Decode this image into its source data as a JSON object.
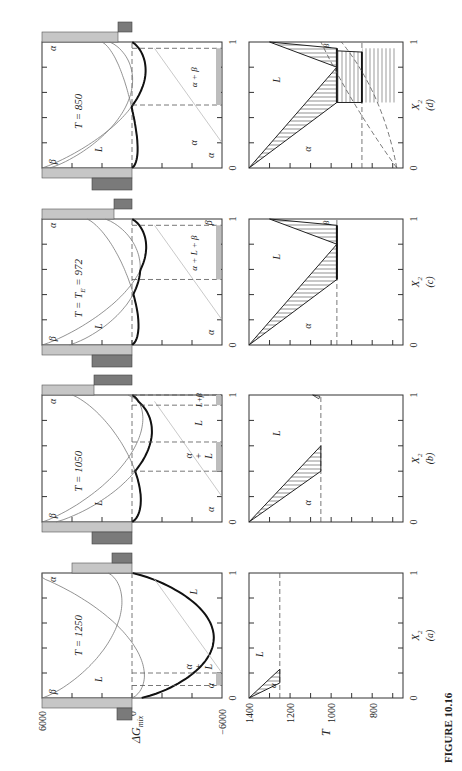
{
  "figure": {
    "caption_label": "FIGURE 10.16",
    "caption_text_partial": "... L  6000  ...  α  8000  ...  β  8000"
  },
  "chart_data": [
    {
      "panel": "a",
      "type": "line",
      "title": "T = 1250",
      "xlabel": "X2",
      "ylabel": "ΔGmix",
      "xlim": [
        0,
        1
      ],
      "ylim": [
        -6000,
        6000
      ],
      "yticks": [
        6000,
        0,
        -6000
      ],
      "xticks": [
        0,
        1
      ],
      "curves": [
        "α",
        "β",
        "L",
        "lower envelope"
      ],
      "region_labels": [
        "α",
        "α + L",
        "L"
      ],
      "arrow_labels": [
        "α"
      ]
    },
    {
      "panel": "a",
      "type": "line",
      "kind": "phase diagram",
      "xlabel": "X2",
      "sublabel": "(a)",
      "ylabel": "T",
      "xlim": [
        0,
        1
      ],
      "ylim": [
        650,
        1400
      ],
      "yticks": [
        1400,
        1200,
        1000,
        800
      ],
      "current_T": 1250,
      "region_labels": [
        "α",
        "L"
      ]
    },
    {
      "panel": "b",
      "type": "line",
      "title": "T = 1050",
      "xlabel": "X2",
      "xlim": [
        0,
        1
      ],
      "ylim": [
        -6000,
        6000
      ],
      "curves": [
        "α",
        "β",
        "L",
        "lower envelope"
      ],
      "region_labels": [
        "α",
        "α + L",
        "L",
        "L + β"
      ],
      "arrow_labels": [
        "β",
        "β"
      ]
    },
    {
      "panel": "b",
      "type": "line",
      "kind": "phase diagram",
      "xlabel": "X2",
      "sublabel": "(b)",
      "xlim": [
        0,
        1
      ],
      "ylim": [
        650,
        1400
      ],
      "current_T": 1050,
      "region_labels": [
        "α",
        "L"
      ],
      "arrow_labels": [
        "β"
      ]
    },
    {
      "panel": "c",
      "type": "line",
      "title": "T = T_E = 972",
      "xlabel": "X2",
      "xlim": [
        0,
        1
      ],
      "ylim": [
        -6000,
        6000
      ],
      "curves": [
        "α",
        "β",
        "L",
        "lower envelope"
      ],
      "region_labels": [
        "α",
        "α + L + β",
        "β"
      ],
      "arrow_labels": [
        "β",
        "β"
      ]
    },
    {
      "panel": "c",
      "type": "line",
      "kind": "phase diagram",
      "xlabel": "X2",
      "sublabel": "(c)",
      "xlim": [
        0,
        1
      ],
      "ylim": [
        650,
        1400
      ],
      "current_T": 972,
      "region_labels": [
        "α",
        "L",
        "β"
      ]
    },
    {
      "panel": "d",
      "type": "line",
      "title": "T = 850",
      "xlabel": "X2",
      "xlim": [
        0,
        1
      ],
      "ylim": [
        -6000,
        6000
      ],
      "curves": [
        "α",
        "β",
        "L",
        "lower envelope"
      ],
      "region_labels": [
        "α",
        "α + β",
        "L"
      ],
      "arrow_labels": [
        "β",
        "β"
      ]
    },
    {
      "panel": "d",
      "type": "line",
      "kind": "phase diagram",
      "xlabel": "X2",
      "sublabel": "(d)",
      "xlim": [
        0,
        1
      ],
      "ylim": [
        650,
        1400
      ],
      "current_T": 850,
      "region_labels": [
        "α",
        "L",
        "β"
      ]
    }
  ],
  "labels": {
    "x0": "0",
    "x1": "1",
    "y6000": "6000",
    "y0": "0",
    "yneg6000": "−6000",
    "dg": "ΔG",
    "dg_sub": "mix",
    "T": "T",
    "t1400": "1400",
    "t1200": "1200",
    "t1000": "1000",
    "t800": "800",
    "X": "X",
    "X_sub": "2",
    "alpha": "α",
    "beta": "β",
    "L": "L",
    "plus": "+",
    "a_title": "T = 1250",
    "b_title": "T = 1050",
    "c_title": "T = T",
    "c_title_sub": "E",
    "c_title_tail": " = 972",
    "d_title": "T = 850",
    "sub_a": "(a)",
    "sub_b": "(b)",
    "sub_c": "(c)",
    "sub_d": "(d)",
    "a_plus_L": "α + L + β",
    "a_plus_b": "α + β"
  }
}
